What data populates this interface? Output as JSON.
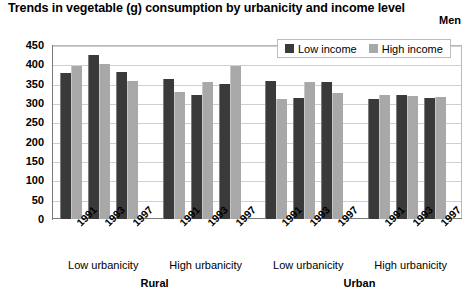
{
  "header": {
    "title": "Trends in vegetable (g) consumption by urbanicity and income level",
    "subtitle": "Men"
  },
  "legend": {
    "position": "top-right",
    "items": [
      {
        "label": "Low income",
        "color": "#3a3a3a",
        "icon": "square-swatch-icon"
      },
      {
        "label": "High income",
        "color": "#a8a8a8",
        "icon": "square-swatch-icon"
      }
    ]
  },
  "axis": {
    "ylabel": "Grams",
    "yticks": [
      "0",
      "50",
      "100",
      "150",
      "200",
      "250",
      "300",
      "350",
      "400",
      "450"
    ],
    "ymin": 0,
    "ymax": 450,
    "ystep": 50,
    "grid": true
  },
  "groups": [
    {
      "urbanicity": "Low urbanicity",
      "region": "Rural"
    },
    {
      "urbanicity": "High urbanicity",
      "region": "Rural"
    },
    {
      "urbanicity": "Low urbanicity",
      "region": "Urban"
    },
    {
      "urbanicity": "High urbanicity",
      "region": "Urban"
    }
  ],
  "regions": [
    {
      "label": "Rural"
    },
    {
      "label": "Urban"
    }
  ],
  "chart_data": {
    "type": "bar",
    "title": "Trends in vegetable (g) consumption by urbanicity and income level",
    "subtitle": "Men",
    "xlabel": "",
    "ylabel": "Grams",
    "ylim": [
      0,
      450
    ],
    "ystep": 50,
    "grid": true,
    "legend_position": "top-right",
    "categories": [
      "Rural / Low urbanicity / 1991",
      "Rural / Low urbanicity / 1993",
      "Rural / Low urbanicity / 1997",
      "Rural / High urbanicity / 1991",
      "Rural / High urbanicity / 1993",
      "Rural / High urbanicity / 1997",
      "Urban / Low urbanicity / 1991",
      "Urban / Low urbanicity / 1993",
      "Urban / Low urbanicity / 1997",
      "Urban / High urbanicity / 1991",
      "Urban / High urbanicity / 1993",
      "Urban / High urbanicity / 1997"
    ],
    "x": [
      "1991",
      "1993",
      "1997",
      "1991",
      "1993",
      "1997",
      "1991",
      "1993",
      "1997",
      "1991",
      "1993",
      "1997"
    ],
    "series": [
      {
        "name": "Low income",
        "color": "#3a3a3a",
        "values": [
          378,
          425,
          380,
          362,
          320,
          350,
          358,
          312,
          355,
          310,
          320,
          312
        ]
      },
      {
        "name": "High income",
        "color": "#a8a8a8",
        "values": [
          395,
          400,
          358,
          328,
          355,
          395,
          310,
          355,
          325,
          322,
          317,
          315
        ]
      }
    ]
  }
}
